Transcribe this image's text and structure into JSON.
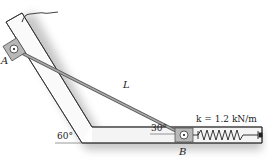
{
  "diagram": {
    "labels": {
      "point_a": "A",
      "point_b": "B",
      "rod_length": "L",
      "spring_constant": "k = 1.2 kN/m",
      "angle_slot": "60°",
      "angle_rod": "30°"
    },
    "colors": {
      "frame_fill": "#ffffff",
      "frame_stroke": "#333333",
      "shadow": "#bdbdbd",
      "collar_fill": "#b8b8b8",
      "rod": "#8a8a8a",
      "text": "#222222"
    },
    "components": [
      "inclined-slot",
      "horizontal-slot",
      "collar-a",
      "collar-b",
      "connecting-rod",
      "spring",
      "cable"
    ]
  }
}
